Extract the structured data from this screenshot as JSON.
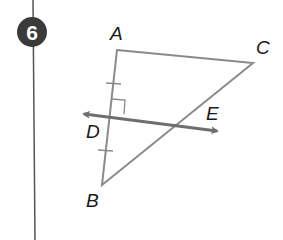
{
  "problem": {
    "number": "6",
    "badge_color": "#3a3a3a"
  },
  "figure": {
    "points": {
      "A": "A",
      "B": "B",
      "C": "C",
      "D": "D",
      "E": "E"
    },
    "line_color": "#8a8a8a",
    "bisector_color": "#6e6e6e",
    "congruence_marks": [
      "AD",
      "DB"
    ],
    "right_angle_at": "D"
  }
}
